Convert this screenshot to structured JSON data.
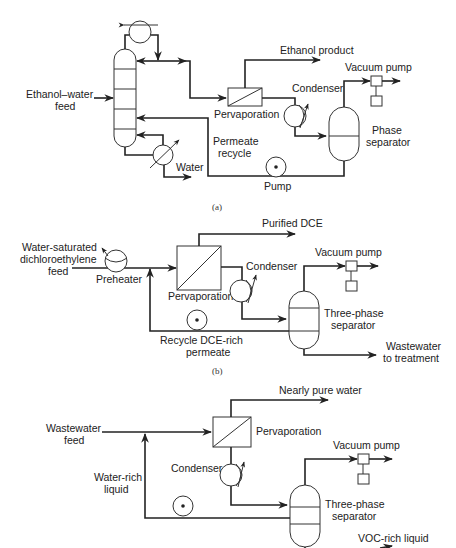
{
  "diagram": {
    "type": "process-flow",
    "panels": [
      {
        "id": "a",
        "caption": "(a)",
        "labels": {
          "feed_line1": "Ethanol–water",
          "feed_line2": "feed",
          "product": "Ethanol product",
          "vacuum_pump": "Vacuum pump",
          "condenser": "Condenser",
          "pervaporation": "Pervaporation",
          "permeate_line1": "Permeate",
          "permeate_line2": "recycle",
          "separator_line1": "Phase",
          "separator_line2": "separator",
          "water": "Water",
          "pump": "Pump"
        }
      },
      {
        "id": "b",
        "caption": "(b)",
        "labels": {
          "feed_line1": "Water-saturated",
          "feed_line2": "dichloroethylene",
          "feed_line3": "feed",
          "preheater": "Preheater",
          "product": "Purified DCE",
          "vacuum_pump": "Vacuum pump",
          "condenser": "Condenser",
          "pervaporation": "Pervaporation",
          "separator_line1": "Three-phase",
          "separator_line2": "separator",
          "recycle_line1": "Recycle DCE-rich",
          "recycle_line2": "permeate",
          "waste_line1": "Wastewater",
          "waste_line2": "to treatment"
        }
      },
      {
        "id": "c",
        "labels": {
          "feed_line1": "Wastewater",
          "feed_line2": "feed",
          "product": "Nearly pure water",
          "pervaporation": "Pervaporation",
          "vacuum_pump": "Vacuum pump",
          "condenser": "Condenser",
          "water_rich_line1": "Water-rich",
          "water_rich_line2": "liquid",
          "separator_line1": "Three-phase",
          "separator_line2": "separator",
          "voc": "VOC-rich liquid"
        }
      }
    ]
  }
}
